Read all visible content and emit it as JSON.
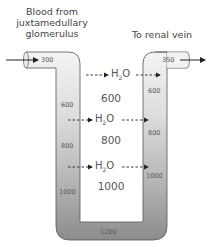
{
  "labels": {
    "inflow": "Blood from juxtamedullary glomerulus",
    "inflow_lines": [
      "Blood from",
      "juxtamedullary",
      "glomerulus"
    ],
    "outflow": "To renal vein"
  },
  "descending_limb": {
    "concentrations": [
      "300",
      "600",
      "800",
      "1000"
    ]
  },
  "ascending_limb": {
    "concentrations": [
      "350",
      "600",
      "800",
      "1000"
    ]
  },
  "loop_bottom": {
    "concentration": "1200"
  },
  "interstitium": {
    "concentrations": [
      "600",
      "800",
      "1000"
    ]
  },
  "water_movement": {
    "label_main": "H",
    "label_sub": "2",
    "label_end": "O",
    "count": 3
  },
  "colors": {
    "tube_light": "#f0f0f0",
    "tube_dark": "#8a8a8a",
    "outline": "#555555",
    "arrow": "#222222"
  }
}
